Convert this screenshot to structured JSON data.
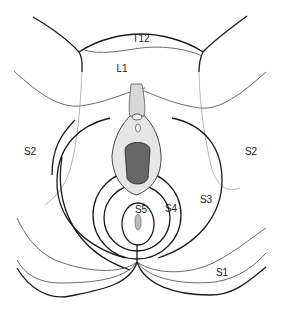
{
  "diagram": {
    "labels": [
      {
        "id": "t12",
        "text": "T12",
        "x": 141,
        "y": 42
      },
      {
        "id": "l1",
        "text": "L1",
        "x": 122,
        "y": 72
      },
      {
        "id": "s2-left",
        "text": "S2",
        "x": 30,
        "y": 155
      },
      {
        "id": "s2-right",
        "text": "S2",
        "x": 251,
        "y": 155
      },
      {
        "id": "s3",
        "text": "S3",
        "x": 206,
        "y": 203
      },
      {
        "id": "s4",
        "text": "S4",
        "x": 171,
        "y": 212
      },
      {
        "id": "s5",
        "text": "S5",
        "x": 141,
        "y": 213
      },
      {
        "id": "s1",
        "text": "S1",
        "x": 222,
        "y": 276
      }
    ]
  }
}
